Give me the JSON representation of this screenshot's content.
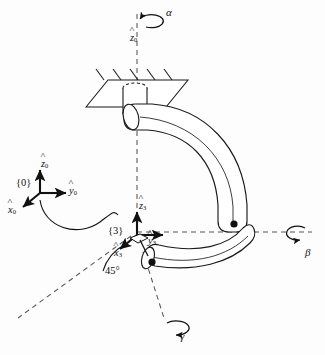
{
  "figure": {
    "type": "kinematic-diagram",
    "background_color": "#fdfdfd",
    "line_color": "#1a1a1a",
    "dash_color": "#555555"
  },
  "rotations": [
    {
      "id": "alpha",
      "symbol": "α",
      "axis_label": "z0",
      "position": "top",
      "about": "vertical base axis"
    },
    {
      "id": "beta",
      "symbol": "β",
      "axis_label": "",
      "position": "right",
      "about": "horizontal axis through tip"
    },
    {
      "id": "gamma",
      "symbol": "γ",
      "axis_label": "",
      "position": "bottom",
      "about": "lower link axis"
    }
  ],
  "frames": [
    {
      "id": "frame0",
      "tag": "{0}",
      "axes": [
        {
          "name": "z0",
          "letter": "z",
          "sub": "0",
          "direction": "up"
        },
        {
          "name": "y0",
          "letter": "y",
          "sub": "0",
          "direction": "right"
        },
        {
          "name": "x0",
          "letter": "x",
          "sub": "0",
          "direction": "down-left"
        }
      ]
    },
    {
      "id": "frame3",
      "tag": "{3}",
      "axes": [
        {
          "name": "z3",
          "letter": "z",
          "sub": "3",
          "direction": "up"
        },
        {
          "name": "y3",
          "letter": "y",
          "sub": "3",
          "direction": "right"
        },
        {
          "name": "x3",
          "letter": "x",
          "sub": "3",
          "direction": "down-left"
        }
      ]
    }
  ],
  "annotations": {
    "angle": {
      "value": "45",
      "unit": "°",
      "text": "45°",
      "between": "x3-axis and dashed reference line"
    },
    "z0_axis_label": {
      "letter": "z",
      "sub": "0"
    },
    "frame0_tag": "{0}",
    "frame3_tag": "{3}",
    "connector": "s-curve arrow from frame {0} to frame {3}"
  },
  "body_parts": [
    {
      "name": "ceiling-plate",
      "description": "hatched parallelogram fixed ground plate"
    },
    {
      "name": "base-cylinder",
      "description": "vertical cylinder joint through the plate"
    },
    {
      "name": "upper-link",
      "description": "curved tube from base bending right and down"
    },
    {
      "name": "lower-link",
      "description": "curved tube from frame {3} to the right tip"
    },
    {
      "name": "joint-dot-upper",
      "description": "black dot at upper link tip"
    },
    {
      "name": "joint-dot-lower",
      "description": "black dot at lower link end"
    }
  ]
}
